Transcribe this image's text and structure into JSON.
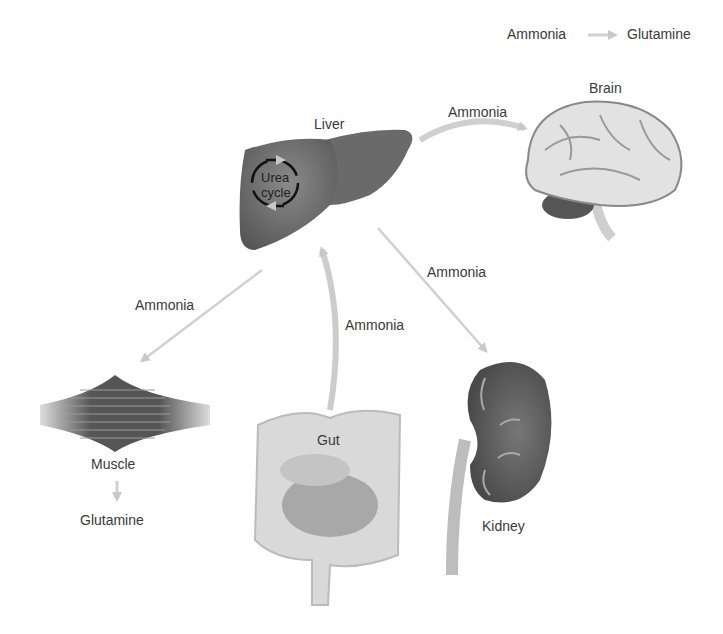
{
  "legend": {
    "from": "Ammonia",
    "to": "Glutamine",
    "arrow_color": "#cfcfcf"
  },
  "organs": {
    "liver": {
      "label": "Liver",
      "inner_label_line1": "Urea",
      "inner_label_line2": "cycle"
    },
    "brain": {
      "label": "Brain"
    },
    "muscle": {
      "label": "Muscle",
      "product": "Glutamine"
    },
    "gut": {
      "label": "Gut"
    },
    "kidney": {
      "label": "Kidney"
    }
  },
  "arrows": {
    "liver_to_brain": "Ammonia",
    "liver_to_kidney": "Ammonia",
    "liver_to_muscle": "Ammonia",
    "gut_to_liver": "Ammonia"
  },
  "colors": {
    "arrow": "#cccccc",
    "organ_dark": "#5f5f5f",
    "organ_light": "#d6d6d6"
  }
}
